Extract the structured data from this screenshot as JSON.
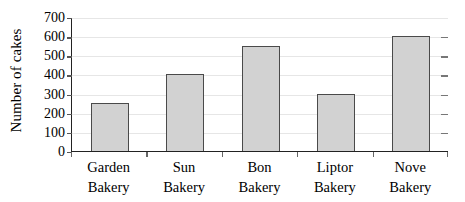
{
  "chart_data": {
    "type": "bar",
    "title": "",
    "xlabel": "",
    "ylabel": "Number of cakes",
    "categories": [
      "Garden Bakery",
      "Sun Bakery",
      "Bon Bakery",
      "Liptor Bakery",
      "Nove Bakery"
    ],
    "category_lines": [
      [
        "Garden",
        "Bakery"
      ],
      [
        "Sun",
        "Bakery"
      ],
      [
        "Bon",
        "Bakery"
      ],
      [
        "Liptor",
        "Bakery"
      ],
      [
        "Nove",
        "Bakery"
      ]
    ],
    "values": [
      250,
      400,
      550,
      300,
      600
    ],
    "ylim": [
      0,
      700
    ],
    "ytick_step": 100,
    "yticks": [
      0,
      100,
      200,
      300,
      400,
      500,
      600,
      700
    ],
    "ytick_labels": [
      "0",
      "100",
      "200",
      "300",
      "400",
      "500",
      "600",
      "700"
    ],
    "grid": true,
    "legend": false,
    "legend_position": "none",
    "bar_fill_color": "#d2d2d2",
    "bar_border_color": "#4a4a4a",
    "gridline_color": "#e6e6e6",
    "axis_color": "#222222",
    "background_color": "#ffffff"
  }
}
